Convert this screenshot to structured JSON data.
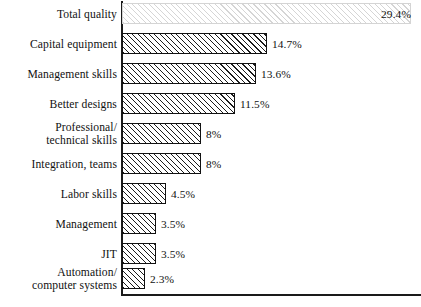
{
  "chart_data": {
    "type": "bar",
    "orientation": "horizontal",
    "title": "",
    "subtitle": "",
    "xlabel": "",
    "ylabel": "",
    "grid": false,
    "legend": null,
    "xlim": [
      0,
      30.4
    ],
    "axis_origin_percent": 0,
    "categories": [
      "Total quality",
      "Capital equipment",
      "Management skills",
      "Better designs",
      "Professional/\ntechnical skills",
      "Integration, teams",
      "Labor skills",
      "Management",
      "JIT",
      "Automation/\ncomputer systems"
    ],
    "values": [
      29.4,
      14.7,
      13.6,
      11.5,
      8,
      8,
      4.5,
      3.5,
      3.5,
      2.3
    ],
    "value_labels": [
      "29.4%",
      "14.7%",
      "13.6%",
      "11.5%",
      "8%",
      "8%",
      "4.5%",
      "3.5%",
      "3.5%",
      "2.3%"
    ],
    "label_placement": [
      "inside",
      "outside",
      "outside",
      "outside",
      "outside",
      "outside",
      "outside",
      "outside",
      "outside",
      "outside"
    ],
    "bar_fill": "hatch-diagonal-45",
    "bar_border_color": "#111111",
    "bar_fill_color": "#ffffff",
    "axis_color": "#1a1a1a",
    "background_color": "#ffffff"
  }
}
